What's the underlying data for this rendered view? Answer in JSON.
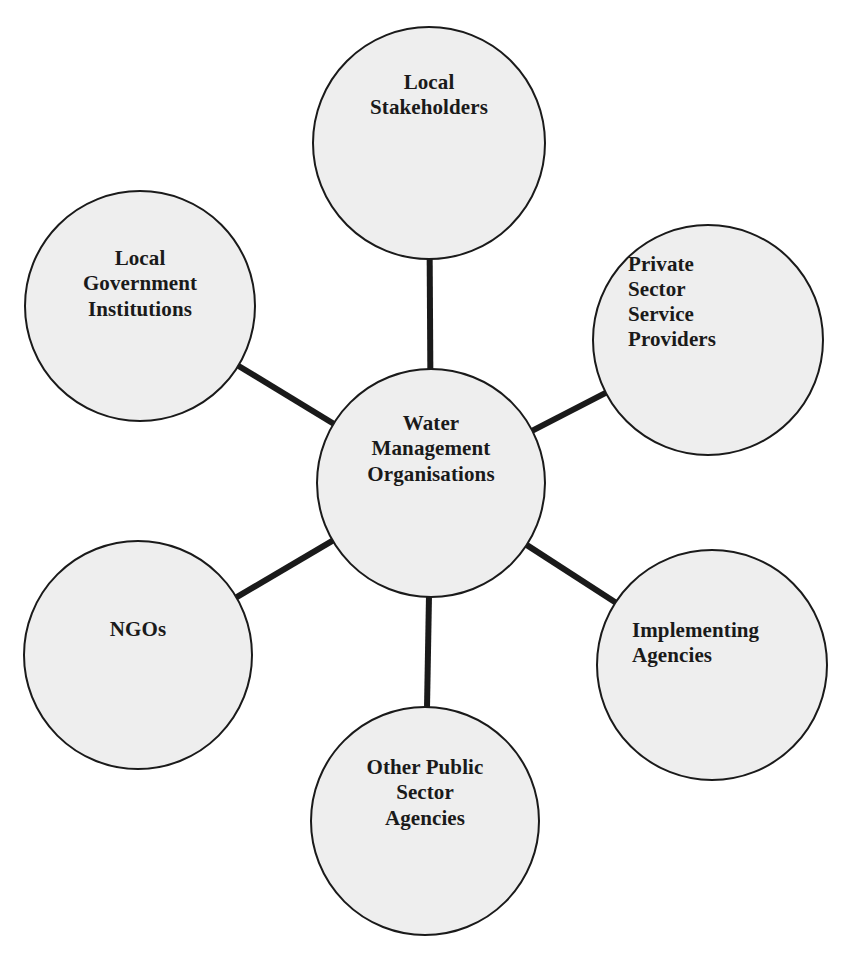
{
  "diagram": {
    "type": "hub-and-spoke",
    "background_color": "#ffffff",
    "node_fill_color": "#eeeeee",
    "node_stroke_color": "#1a1a1a",
    "connector_color": "#1a1a1a",
    "center": {
      "id": "water-management-organisations",
      "label": "Water\nManagement\nOrganisations",
      "lines": [
        "Water",
        "Management",
        "Organisations"
      ],
      "cx": 431,
      "cy": 483,
      "r": 114,
      "font_size": 21,
      "text_offset_y": -34,
      "text_align": "center"
    },
    "nodes": [
      {
        "id": "local-stakeholders",
        "label": "Local\nStakeholders",
        "lines": [
          "Local",
          "Stakeholders"
        ],
        "cx": 429,
        "cy": 143,
        "r": 116,
        "font_size": 21,
        "text_offset_y": -48,
        "text_align": "center"
      },
      {
        "id": "local-government-institutions",
        "label": "Local\nGovernment\nInstitutions",
        "lines": [
          "Local",
          "Government",
          "Institutions"
        ],
        "cx": 140,
        "cy": 306,
        "r": 115,
        "font_size": 21,
        "text_offset_y": -22,
        "text_align": "center"
      },
      {
        "id": "private-sector-service-providers",
        "label": "Private\nSector\nService\nProviders",
        "lines": [
          "Private",
          "Sector",
          "Service",
          "Providers"
        ],
        "cx": 708,
        "cy": 340,
        "r": 115,
        "font_size": 21,
        "text_offset_y": -38,
        "text_align": "left"
      },
      {
        "id": "ngos",
        "label": "NGOs",
        "lines": [
          "NGOs"
        ],
        "cx": 138,
        "cy": 655,
        "r": 114,
        "font_size": 21,
        "text_offset_y": -25,
        "text_align": "center"
      },
      {
        "id": "implementing-agencies",
        "label": "Implementing\nAgencies",
        "lines": [
          "Implementing",
          "Agencies"
        ],
        "cx": 712,
        "cy": 665,
        "r": 115,
        "font_size": 21,
        "text_offset_y": -22,
        "text_align": "left"
      },
      {
        "id": "other-public-sector-agencies",
        "label": "Other Public\nSector\nAgencies",
        "lines": [
          "Other Public",
          "Sector",
          "Agencies"
        ],
        "cx": 425,
        "cy": 821,
        "r": 114,
        "font_size": 21,
        "text_offset_y": -28,
        "text_align": "center"
      }
    ],
    "connectors": [
      {
        "id": "connector-center-local-stakeholders",
        "from": "water-management-organisations",
        "to": "local-stakeholders",
        "width": 6
      },
      {
        "id": "connector-center-local-government-institutions",
        "from": "water-management-organisations",
        "to": "local-government-institutions",
        "width": 6
      },
      {
        "id": "connector-center-private-sector-service-providers",
        "from": "water-management-organisations",
        "to": "private-sector-service-providers",
        "width": 6
      },
      {
        "id": "connector-center-ngos",
        "from": "water-management-organisations",
        "to": "ngos",
        "width": 6
      },
      {
        "id": "connector-center-implementing-agencies",
        "from": "water-management-organisations",
        "to": "implementing-agencies",
        "width": 6
      },
      {
        "id": "connector-center-other-public-sector-agencies",
        "from": "water-management-organisations",
        "to": "other-public-sector-agencies",
        "width": 6
      }
    ]
  }
}
